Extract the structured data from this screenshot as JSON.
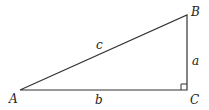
{
  "diagram": {
    "type": "right-triangle",
    "vertices": {
      "A": {
        "label": "A",
        "x": 20,
        "y": 90
      },
      "B": {
        "label": "B",
        "x": 187,
        "y": 15
      },
      "C": {
        "label": "C",
        "x": 187,
        "y": 90
      }
    },
    "sides": {
      "a": {
        "label": "a",
        "from": "B",
        "to": "C"
      },
      "b": {
        "label": "b",
        "from": "A",
        "to": "C"
      },
      "c": {
        "label": "c",
        "from": "A",
        "to": "B"
      }
    },
    "right_angle_at": "C",
    "stroke_color": "#333333"
  }
}
